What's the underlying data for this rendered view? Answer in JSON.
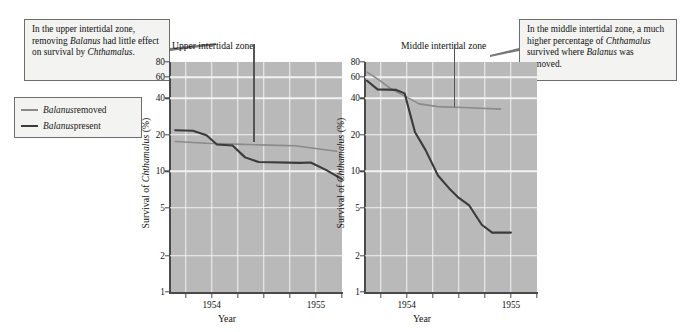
{
  "callouts": {
    "left": {
      "name": "upper-zone-annotation",
      "lines": [
        {
          "text": "In the upper intertidal"
        },
        {
          "text": "zone, removing "
        },
        {
          "text": "had little effect on"
        },
        {
          "text": "survival by "
        }
      ],
      "full_text": "In the upper intertidal zone, removing Balanus had little effect on survival by Chthamalus.",
      "italic_1": "Balanus",
      "italic_2": "Chthamalus",
      "tail": "."
    },
    "right": {
      "name": "middle-zone-annotation",
      "full_text": "In the middle intertidal zone, a much higher percentage of Chthamalus survived where Balanus was removed.",
      "line1": "In the middle intertidal zone,",
      "line2": "a much higher percentage of",
      "line3_italic": "Chthamalus",
      "line3_rest": " survived where",
      "line4_italic": "Balanus",
      "line4_rest": " was removed."
    }
  },
  "legend": {
    "title": "",
    "items": [
      {
        "label_italic": "Balanus",
        "label_rest": " removed",
        "color": "#8a8a8a",
        "key": "balanus-removed"
      },
      {
        "label_italic": "Balanus",
        "label_rest": " present",
        "color": "#3b3b3b",
        "key": "balanus-present"
      }
    ]
  },
  "colors": {
    "plot_background": "#b9b9b9",
    "gridline": "#f2f2f2",
    "axis": "#4a4a4a",
    "series_removed": "#8a8a8a",
    "series_present": "#3b3b3b",
    "callout_border": "#6d6d6d",
    "callout_background": "#f3f3f1"
  },
  "chart_data": [
    {
      "type": "line",
      "title": "Upper intertidal zone",
      "xlabel": "Year",
      "ylabel": "Survival of Chthamalus (%)",
      "ylabel_italic": "Chthamalus",
      "yscale": "log",
      "ylim": [
        1,
        80
      ],
      "yticks": [
        1,
        2,
        5,
        10,
        20,
        40,
        60,
        80
      ],
      "ytick_labels": [
        "1",
        "2",
        "5",
        "10",
        "20",
        "40",
        "60",
        "80"
      ],
      "gridlines_y": [
        2,
        5,
        10,
        20,
        40,
        60
      ],
      "xlim": [
        1953.6,
        1955.25
      ],
      "xticks": [
        1953.75,
        1954.0,
        1954.25,
        1954.5,
        1954.75,
        1955.0,
        1955.25
      ],
      "xtick_labels": [
        {
          "value": 1954.0,
          "label": "1954"
        },
        {
          "value": 1955.0,
          "label": "1955"
        }
      ],
      "gridlines_x": [
        1953.75,
        1954.0,
        1954.25,
        1954.5,
        1954.75,
        1955.0
      ],
      "grid": true,
      "legend_position": "external-left",
      "pointer": {
        "x": 1954.4,
        "y_top": 80,
        "y_bottom": 17.5,
        "label": "Upper intertidal zone"
      },
      "series": [
        {
          "name": "Balanus removed",
          "color": "#8a8a8a",
          "points": [
            {
              "x": 1953.65,
              "y": 17.6
            },
            {
              "x": 1953.95,
              "y": 17.0
            },
            {
              "x": 1954.15,
              "y": 16.8
            },
            {
              "x": 1954.45,
              "y": 16.5
            },
            {
              "x": 1954.8,
              "y": 16.2
            },
            {
              "x": 1955.05,
              "y": 15.2
            },
            {
              "x": 1955.2,
              "y": 14.6
            }
          ]
        },
        {
          "name": "Balanus present",
          "color": "#3b3b3b",
          "points": [
            {
              "x": 1953.65,
              "y": 21.8
            },
            {
              "x": 1953.82,
              "y": 21.6
            },
            {
              "x": 1953.95,
              "y": 19.8
            },
            {
              "x": 1954.05,
              "y": 16.6
            },
            {
              "x": 1954.2,
              "y": 16.3
            },
            {
              "x": 1954.32,
              "y": 13.0
            },
            {
              "x": 1954.45,
              "y": 11.9
            },
            {
              "x": 1954.85,
              "y": 11.7
            },
            {
              "x": 1954.95,
              "y": 11.8
            },
            {
              "x": 1955.1,
              "y": 10.2
            },
            {
              "x": 1955.25,
              "y": 8.6
            }
          ]
        }
      ]
    },
    {
      "type": "line",
      "title": "Middle intertidal zone",
      "xlabel": "Year",
      "ylabel": "Survival of Chthamalus (%)",
      "ylabel_italic": "Chthamalus",
      "yscale": "log",
      "ylim": [
        1,
        80
      ],
      "yticks": [
        1,
        2,
        5,
        10,
        20,
        40,
        60,
        80
      ],
      "ytick_labels": [
        "1",
        "2",
        "5",
        "10",
        "20",
        "40",
        "60",
        "80"
      ],
      "gridlines_y": [
        2,
        5,
        10,
        20,
        40,
        60
      ],
      "xlim": [
        1953.6,
        1955.25
      ],
      "xticks": [
        1953.75,
        1954.0,
        1954.25,
        1954.5,
        1954.75,
        1955.0,
        1955.25
      ],
      "xtick_labels": [
        {
          "value": 1954.0,
          "label": "1954"
        },
        {
          "value": 1955.0,
          "label": "1955"
        }
      ],
      "gridlines_x": [
        1953.75,
        1954.0,
        1954.25,
        1954.5,
        1954.75,
        1955.0
      ],
      "grid": true,
      "legend_position": "external-left",
      "pointer": {
        "x": 1954.45,
        "y_top": 80,
        "y_bottom": 34.0,
        "label": "Middle intertidal zone"
      },
      "series": [
        {
          "name": "Balanus removed",
          "color": "#8a8a8a",
          "points": [
            {
              "x": 1953.62,
              "y": 66.0
            },
            {
              "x": 1953.72,
              "y": 58.0
            },
            {
              "x": 1953.85,
              "y": 48.0
            },
            {
              "x": 1954.0,
              "y": 41.0
            },
            {
              "x": 1954.12,
              "y": 36.0
            },
            {
              "x": 1954.3,
              "y": 34.2
            },
            {
              "x": 1954.6,
              "y": 33.5
            },
            {
              "x": 1954.9,
              "y": 32.6
            }
          ]
        },
        {
          "name": "Balanus present",
          "color": "#3b3b3b",
          "points": [
            {
              "x": 1953.62,
              "y": 56.0
            },
            {
              "x": 1953.72,
              "y": 47.5
            },
            {
              "x": 1953.9,
              "y": 47.0
            },
            {
              "x": 1953.98,
              "y": 44.0
            },
            {
              "x": 1954.08,
              "y": 21.0
            },
            {
              "x": 1954.18,
              "y": 15.0
            },
            {
              "x": 1954.3,
              "y": 9.2
            },
            {
              "x": 1954.42,
              "y": 7.0
            },
            {
              "x": 1954.5,
              "y": 6.0
            },
            {
              "x": 1954.6,
              "y": 5.2
            },
            {
              "x": 1954.72,
              "y": 3.6
            },
            {
              "x": 1954.82,
              "y": 3.1
            },
            {
              "x": 1955.0,
              "y": 3.1
            }
          ]
        }
      ]
    }
  ]
}
